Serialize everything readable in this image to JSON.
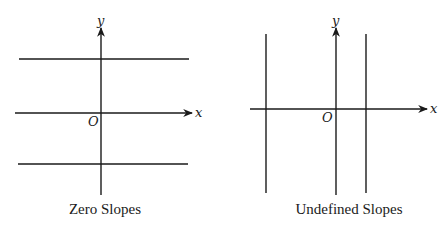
{
  "panels": [
    {
      "title": "Zero Slopes",
      "x_axis_label": "x",
      "y_axis_label": "y",
      "origin_label": "O",
      "line_type": "horizontal",
      "line_count": 2,
      "description": "Two horizontal lines, one above and one below the x-axis, both with slope 0"
    },
    {
      "title": "Undefined Slopes",
      "x_axis_label": "x",
      "y_axis_label": "y",
      "origin_label": "O",
      "line_type": "vertical",
      "line_count": 2,
      "description": "Two vertical lines, one left and one right of the y-axis, both with undefined slope"
    }
  ],
  "colors": {
    "line": "#1a1a1a",
    "background": "#ffffff"
  }
}
